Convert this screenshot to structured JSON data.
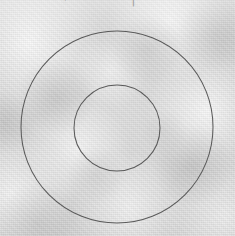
{
  "image": {
    "title": "Concentric circles target diagram",
    "width": 235,
    "height": 236,
    "background_color": "#d0d0d0",
    "surface_description": "mottled light-gray paper / concrete texture",
    "stroke_color": "#5a5a5a",
    "stroke_width": 1
  },
  "top_edge": {
    "description": "faint cropped glyph fragments along the top border",
    "fragments": [
      {
        "text": "—",
        "left": 52,
        "top": -6
      },
      {
        "text": "⌐",
        "left": 64,
        "top": -7
      },
      {
        "text": "┐",
        "left": 128,
        "top": -7
      },
      {
        "text": "‵",
        "left": 146,
        "top": -7
      }
    ]
  },
  "chart_data": {
    "type": "scatter",
    "subtitle": "",
    "xlabel": "",
    "ylabel": "",
    "grid": false,
    "legend_position": "none",
    "xlim": [
      0,
      235
    ],
    "ylim": [
      0,
      236
    ],
    "center": {
      "x": 117,
      "y": 127
    },
    "shapes": [
      {
        "name": "outer-circle",
        "type": "circle",
        "cx": 117,
        "cy": 127,
        "r": 96,
        "diameter": 192,
        "stroke": "#5a5a5a",
        "stroke_width": 1,
        "fill": "none"
      },
      {
        "name": "inner-circle",
        "type": "circle",
        "cx": 117,
        "cy": 128,
        "r": 43,
        "diameter": 86,
        "stroke": "#5a5a5a",
        "stroke_width": 1,
        "fill": "none"
      }
    ],
    "annotations": [],
    "tick_labels": {
      "x": [],
      "y": []
    }
  }
}
